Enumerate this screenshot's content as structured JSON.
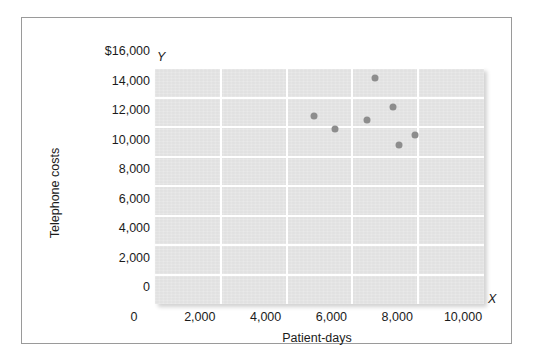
{
  "chart_data": {
    "type": "scatter",
    "title": "",
    "xlabel": "Patient-days",
    "ylabel": "Telephone costs",
    "x_axis_letter": "X",
    "y_axis_letter": "Y",
    "xlim": [
      0,
      10000
    ],
    "ylim": [
      0,
      16000
    ],
    "grid": true,
    "legend": "none",
    "xticks": [
      "0",
      "2,000",
      "4,000",
      "6,000",
      "8,000",
      "10,000"
    ],
    "xtick_values": [
      0,
      2000,
      4000,
      6000,
      8000,
      10000
    ],
    "yticks": [
      "0",
      "2,000",
      "4,000",
      "6,000",
      "8,000",
      "10,000",
      "12,000",
      "14,000",
      "$16,000"
    ],
    "ytick_values": [
      0,
      2000,
      4000,
      6000,
      8000,
      10000,
      12000,
      14000,
      16000
    ],
    "points": [
      {
        "x": 4820,
        "y": 12750
      },
      {
        "x": 5480,
        "y": 11860
      },
      {
        "x": 6450,
        "y": 12470
      },
      {
        "x": 6700,
        "y": 15320
      },
      {
        "x": 7240,
        "y": 13350
      },
      {
        "x": 7420,
        "y": 10780
      },
      {
        "x": 7910,
        "y": 11460
      }
    ],
    "marker_color": "#8d8d8d",
    "plot_bg_color": "#e4e4e4",
    "gridline_color": "#ffffff",
    "frame_color": "#9a9a9a"
  }
}
